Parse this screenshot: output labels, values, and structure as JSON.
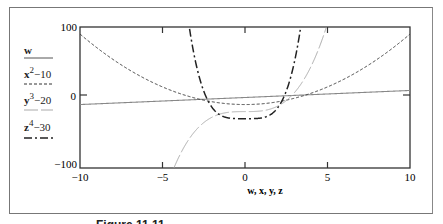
{
  "chart_data": {
    "type": "line",
    "title": "",
    "xlabel": "w, x, y, z",
    "ylabel": "",
    "xlim": [
      -10,
      10
    ],
    "ylim": [
      -100,
      100
    ],
    "x_ticks": [
      "-10",
      "-5",
      "0",
      "5",
      "10"
    ],
    "y_ticks": [
      "100",
      "0",
      "-100"
    ],
    "grid": false,
    "legend_position": "left",
    "series": [
      {
        "name": "w",
        "expression": "w",
        "style": "solid",
        "color": "#888888",
        "x": [
          -10,
          -5,
          0,
          5,
          10
        ],
        "values": [
          -10,
          -5,
          0,
          5,
          10
        ]
      },
      {
        "name": "x^2-10",
        "expression": "x^2 - 10",
        "style": "dashed (short)",
        "color": "#444444",
        "x": [
          -10,
          -7.5,
          -5,
          -2.5,
          0,
          2.5,
          5,
          7.5,
          10
        ],
        "values": [
          90,
          46.25,
          15,
          -3.75,
          -10,
          -3.75,
          15,
          46.25,
          90
        ]
      },
      {
        "name": "y^3-20",
        "expression": "y^3 - 20",
        "style": "long dash (light gray)",
        "color": "#aaaaaa",
        "x": [
          -4.2,
          -3,
          -2,
          -1,
          0,
          1,
          2,
          3,
          4.9
        ],
        "values": [
          -94.1,
          -47,
          -28,
          -21,
          -20,
          -19,
          -12,
          7,
          97.6
        ]
      },
      {
        "name": "z^4-30",
        "expression": "z^4 - 30",
        "style": "dash-dot",
        "color": "#222222",
        "x": [
          -3.6,
          -3,
          -2,
          -1,
          0,
          1,
          2,
          3,
          3.6
        ],
        "values": [
          138,
          51,
          -14,
          -29,
          -30,
          -29,
          -14,
          51,
          138
        ]
      }
    ]
  },
  "legend": {
    "items": [
      {
        "base": "w",
        "exp": "",
        "rest": ""
      },
      {
        "base": "x",
        "exp": "2",
        "rest": "−10"
      },
      {
        "base": "y",
        "exp": "3",
        "rest": "−20"
      },
      {
        "base": "z",
        "exp": "4",
        "rest": "−30"
      }
    ]
  },
  "axes": {
    "y_top": "100",
    "y_mid": "0",
    "y_bottom": "−100",
    "x_ticks": [
      "−10",
      "−5",
      "0",
      "5",
      "10"
    ],
    "x_label": "w, x, y, z"
  },
  "caption": "Figure 11.11 ..."
}
